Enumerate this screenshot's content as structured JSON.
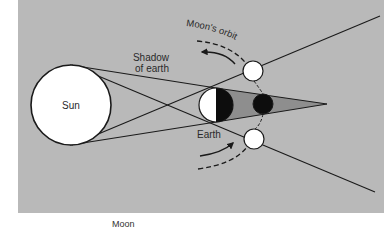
{
  "diagram": {
    "colors": {
      "panel_bg": "#b9b9b9",
      "umbra": "#8e8e8e",
      "line": "#1a1a1a",
      "body_fill": "#ffffff",
      "dark_fill": "#0d0d0d"
    },
    "labels": {
      "sun": "Sun",
      "earth": "Earth",
      "shadow_line1": "Shadow",
      "shadow_line2": "of earth",
      "moons_orbit": "Moon's orbit"
    },
    "bodies": {
      "sun": {
        "cx": 71,
        "cy": 105,
        "r": 40
      },
      "earth": {
        "cx": 216,
        "cy": 105,
        "r": 17
      },
      "moon_top": {
        "cx": 253,
        "cy": 71,
        "r": 10
      },
      "moon_eclipsed": {
        "cx": 263,
        "cy": 104,
        "r": 10
      },
      "moon_bottom": {
        "cx": 254,
        "cy": 139,
        "r": 10
      }
    },
    "umbra_tip": {
      "x": 327,
      "y": 104
    }
  },
  "caption": {
    "text": "Moon"
  }
}
